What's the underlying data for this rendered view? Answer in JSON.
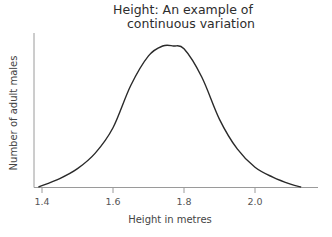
{
  "chart_data": {
    "type": "line",
    "title": "Height: An example of continuous variation",
    "title_lines": [
      "Height: An example of",
      "continuous variation"
    ],
    "xlabel": "Height in metres",
    "ylabel": "Number of adult males",
    "x_ticks": [
      "1.4",
      "1.6",
      "1.8",
      "2.0"
    ],
    "x_tick_values": [
      1.4,
      1.6,
      1.8,
      2.0
    ],
    "xlim": [
      1.38,
      2.18
    ],
    "y_ticks": [],
    "grid": false,
    "legend": null,
    "series": [
      {
        "name": "Distribution of height (normal curve)",
        "x": [
          1.39,
          1.45,
          1.5,
          1.55,
          1.6,
          1.65,
          1.7,
          1.74,
          1.77,
          1.8,
          1.85,
          1.9,
          1.95,
          2.0,
          2.05,
          2.1,
          2.13
        ],
        "y_relative": [
          0.0,
          0.06,
          0.13,
          0.24,
          0.42,
          0.72,
          0.93,
          1.0,
          1.0,
          0.98,
          0.78,
          0.48,
          0.27,
          0.14,
          0.07,
          0.02,
          0.0
        ]
      }
    ],
    "peak_x": 1.77
  }
}
